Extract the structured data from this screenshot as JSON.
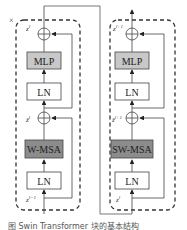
{
  "diagram": {
    "corner_mark": "×",
    "blocks": [
      {
        "name": "block-l",
        "layers": [
          "MLP",
          "LN",
          "W-MSA",
          "LN"
        ],
        "labels": {
          "output": "z^l",
          "mid": "ẑ^l",
          "input": "z^{l-1}"
        }
      },
      {
        "name": "block-l-plus-1",
        "layers": [
          "MLP",
          "LN",
          "SW-MSA",
          "LN"
        ],
        "labels": {
          "output": "z^{l+1}",
          "mid": "ẑ^{l+1}",
          "input": "z^l"
        }
      }
    ],
    "caption": "图 Swin Transformer 块的基本结构"
  },
  "colors": {
    "dark_box": "#8c8c8c",
    "light_box": "#c8c8c8",
    "plain_box": "#ffffff",
    "stroke": "#555555"
  }
}
